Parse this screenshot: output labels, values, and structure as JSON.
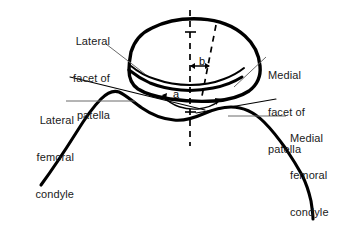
{
  "figure": {
    "kind": "anatomical-line-drawing",
    "background_color": "#ffffff",
    "ink_color": "#000000",
    "leader_color": "#5a5a5a",
    "text_color": "#1a1a1a"
  },
  "labels": {
    "lateral_facet": {
      "line1": "Lateral",
      "line2": "facet of",
      "line3": "patella"
    },
    "lateral_condyle": {
      "line1": "Lateral",
      "line2": "femoral",
      "line3": "condyle"
    },
    "medial_facet": {
      "line1": "Medial",
      "line2": "facet of",
      "line3": "patella"
    },
    "medial_condyle": {
      "line1": "Medial",
      "line2": "femoral",
      "line3": "condyle"
    }
  },
  "measurements": {
    "angle_a": "a",
    "distance_b": "b"
  },
  "structures": {
    "patella": "patella-outline",
    "patella_articular_ridge": "patella-articular-surface",
    "femoral_trochlea": "femoral-condyle-outline",
    "vertical_reference_axis": "vertical-dashed-axis",
    "oblique_reference_axis": "oblique-dashed-axis"
  }
}
